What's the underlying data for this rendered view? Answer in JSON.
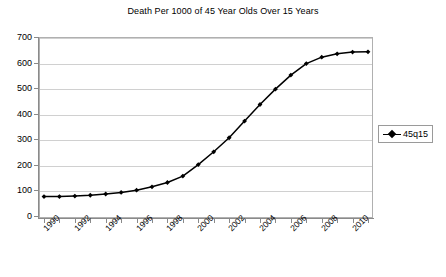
{
  "chart_data": {
    "type": "line",
    "title": "Death Per 1000 of 45 Year Olds Over 15 Years",
    "xlabel": "",
    "ylabel": "",
    "ylim": [
      0,
      700
    ],
    "ytick_step": 100,
    "yticks": [
      0,
      100,
      200,
      300,
      400,
      500,
      600,
      700
    ],
    "xlim": [
      1990,
      2011
    ],
    "xtick_labels": [
      "1990",
      "1992",
      "1994",
      "1996",
      "1998",
      "2000",
      "2002",
      "2004",
      "2006",
      "2008",
      "2010"
    ],
    "grid": true,
    "legend_position": "right",
    "series": [
      {
        "name": "45q15",
        "marker": "diamond",
        "color": "#000000",
        "x": [
          1990,
          1991,
          1992,
          1993,
          1994,
          1995,
          1996,
          1997,
          1998,
          1999,
          2000,
          2001,
          2002,
          2003,
          2004,
          2005,
          2006,
          2007,
          2008,
          2009,
          2010,
          2011
        ],
        "values": [
          80,
          80,
          82,
          85,
          90,
          96,
          105,
          118,
          135,
          160,
          205,
          255,
          310,
          375,
          440,
          500,
          555,
          600,
          625,
          638,
          645,
          646
        ]
      }
    ]
  },
  "legend": {
    "entries": [
      {
        "label": "45q15",
        "marker_icon": "diamond-line-marker"
      }
    ]
  }
}
